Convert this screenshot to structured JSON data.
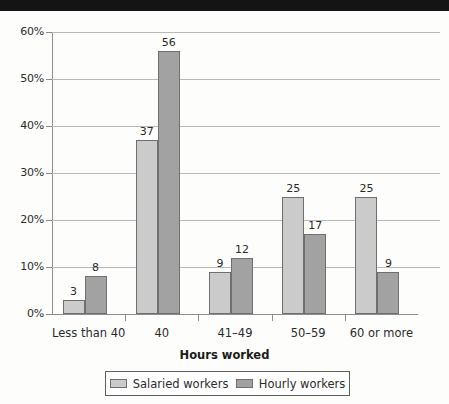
{
  "figure": {
    "background_color": "#fdfdfc",
    "scan_band_color": "#141414"
  },
  "chart_data": {
    "type": "bar",
    "title": "",
    "subtitle": "",
    "xlabel": "Hours worked",
    "ylabel": "",
    "categories": [
      "Less than 40",
      "40",
      "41–49",
      "50–59",
      "60 or more"
    ],
    "series": [
      {
        "name": "Salaried workers",
        "color": "#cbcbcb",
        "values": [
          3,
          37,
          9,
          25,
          25
        ],
        "labels": [
          "3",
          "37",
          "9",
          "25",
          "25"
        ]
      },
      {
        "name": "Hourly workers",
        "color": "#a2a2a2",
        "values": [
          8,
          56,
          12,
          17,
          9
        ],
        "labels": [
          "8",
          "56",
          "12",
          "17",
          "9"
        ]
      }
    ],
    "ylim": [
      0,
      60
    ],
    "ytick_values": [
      0,
      10,
      20,
      30,
      40,
      50,
      60
    ],
    "ytick_labels": [
      "0%",
      "10%",
      "20%",
      "30%",
      "40%",
      "50%",
      "60%"
    ],
    "y_unit": "percent",
    "grid": true,
    "grid_axis": "y",
    "legend_position": "bottom",
    "value_labels_shown": true,
    "bar_outline_color": "#6f6f6f",
    "gridline_color": "#b9b9b9",
    "axis_color": "#8d8d8d"
  },
  "axis": {
    "x_title": "Hours worked"
  },
  "legend": {
    "entries": [
      {
        "label": "Salaried workers",
        "swatch": "salaried"
      },
      {
        "label": "Hourly workers",
        "swatch": "hourly"
      }
    ]
  }
}
